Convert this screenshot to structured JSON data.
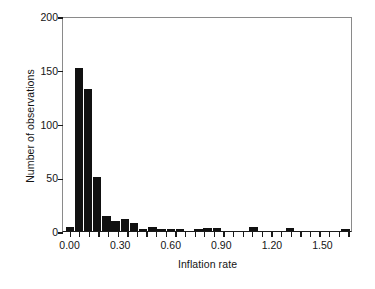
{
  "chart_data": {
    "type": "bar",
    "title": "",
    "xlabel": "Inflation rate",
    "ylabel": "Number of observations",
    "xlim": [
      -0.045,
      1.675
    ],
    "ylim": [
      0,
      200
    ],
    "xticks": [
      0.0,
      0.3,
      0.6,
      0.9,
      1.2,
      1.5
    ],
    "xtick_labels": [
      "0.00",
      "0.30",
      "0.60",
      "0.90",
      "1.20",
      "1.50"
    ],
    "xminor_tick_step": 0.057,
    "yticks": [
      0,
      50,
      100,
      150,
      200
    ],
    "ytick_labels": [
      "0",
      "50",
      "100",
      "150",
      "200"
    ],
    "grid": false,
    "legend": null,
    "bar_color": "#111111",
    "bin_width": 0.0545,
    "bin_starts": [
      -0.03,
      0.0245,
      0.079,
      0.1335,
      0.188,
      0.2425,
      0.297,
      0.3515,
      0.406,
      0.4605,
      0.515,
      0.5695,
      0.624,
      0.6785,
      0.733,
      0.7875,
      0.842,
      0.8965,
      0.951,
      1.0055,
      1.06,
      1.1145,
      1.169,
      1.2235,
      1.278,
      1.3325,
      1.387,
      1.4415,
      1.496,
      1.5505,
      1.605
    ],
    "values": [
      4,
      152,
      132,
      50,
      14,
      9,
      11,
      7,
      2,
      4,
      1,
      2,
      2,
      0,
      2,
      3,
      3,
      0,
      0,
      0,
      4,
      0,
      0,
      0,
      3,
      0,
      0,
      0,
      0,
      0,
      2
    ]
  }
}
